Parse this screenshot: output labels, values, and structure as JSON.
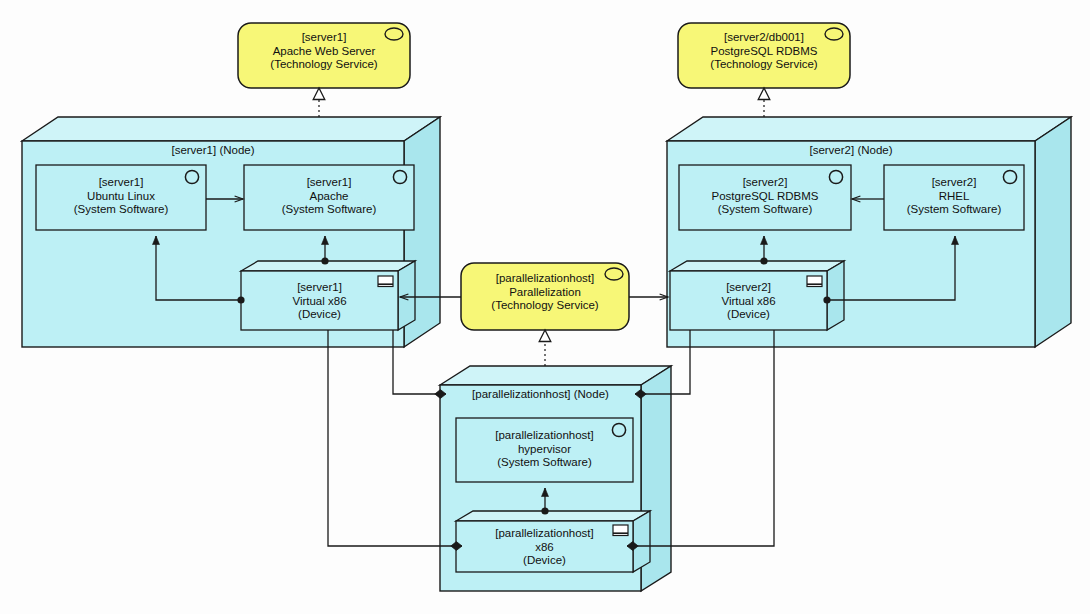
{
  "diagram": {
    "notation": "ArchiMate",
    "colors": {
      "service_fill": "#F7F777",
      "node_fill": "#BDF0F5",
      "node_top_fill": "#CFF4F8",
      "node_side_fill": "#A9E6ED",
      "inner_fill": "#BDF0F5",
      "stroke": "#1a1a1a",
      "background": "#FDFDFD"
    }
  },
  "services": [
    {
      "id": "apache-web-server",
      "qualifier": "[server1]",
      "name": "Apache Web Server",
      "type": "(Technology Service)",
      "icon": "rounded-oval-icon"
    },
    {
      "id": "postgresql-rdbms-service",
      "qualifier": "[server2/db001]",
      "name": "PostgreSQL RDBMS",
      "type": "(Technology Service)",
      "icon": "rounded-oval-icon"
    },
    {
      "id": "parallelization",
      "qualifier": "[parallelizationhost]",
      "name": "Parallelization",
      "type": "(Technology Service)",
      "icon": "rounded-oval-icon"
    }
  ],
  "nodes": [
    {
      "id": "server1-node",
      "title": "[server1] (Node)",
      "system_software": [
        {
          "id": "server1-ubuntu",
          "qualifier": "[server1]",
          "name": "Ubuntu Linux",
          "type": "(System Software)",
          "icon": "circle-icon"
        },
        {
          "id": "server1-apache",
          "qualifier": "[server1]",
          "name": "Apache",
          "type": "(System Software)",
          "icon": "circle-icon"
        }
      ],
      "devices": [
        {
          "id": "server1-virtual-x86",
          "qualifier": "[server1]",
          "name": "Virtual x86",
          "type": "(Device)",
          "icon": "monitor-icon"
        }
      ]
    },
    {
      "id": "server2-node",
      "title": "[server2] (Node)",
      "system_software": [
        {
          "id": "server2-postgresql",
          "qualifier": "[server2]",
          "name": "PostgreSQL RDBMS",
          "type": "(System Software)",
          "icon": "circle-icon"
        },
        {
          "id": "server2-rhel",
          "qualifier": "[server2]",
          "name": "RHEL",
          "type": "(System Software)",
          "icon": "circle-icon"
        }
      ],
      "devices": [
        {
          "id": "server2-virtual-x86",
          "qualifier": "[server2]",
          "name": "Virtual x86",
          "type": "(Device)",
          "icon": "monitor-icon"
        }
      ]
    },
    {
      "id": "parallelizationhost-node",
      "title": "[parallelizationhost] (Node)",
      "system_software": [
        {
          "id": "parallelizationhost-hypervisor",
          "qualifier": "[parallelizationhost]",
          "name": "hypervisor",
          "type": "(System Software)",
          "icon": "circle-icon"
        }
      ],
      "devices": [
        {
          "id": "parallelizationhost-x86",
          "qualifier": "[parallelizationhost]",
          "name": "x86",
          "type": "(Device)",
          "icon": "monitor-icon"
        }
      ]
    }
  ],
  "relationships": [
    {
      "id": "r1",
      "kind": "realization",
      "from": "server1-apache",
      "to": "apache-web-server"
    },
    {
      "id": "r2",
      "kind": "realization",
      "from": "server2-postgresql",
      "to": "postgresql-rdbms-service"
    },
    {
      "id": "r3",
      "kind": "realization",
      "from": "parallelizationhost-hypervisor",
      "to": "parallelization"
    },
    {
      "id": "r4",
      "kind": "serving",
      "from": "server1-ubuntu",
      "to": "server1-apache"
    },
    {
      "id": "r5",
      "kind": "serving",
      "from": "server2-rhel",
      "to": "server2-postgresql"
    },
    {
      "id": "r6",
      "kind": "assignment",
      "from": "server1-virtual-x86",
      "to": "server1-ubuntu"
    },
    {
      "id": "r7",
      "kind": "assignment",
      "from": "server1-virtual-x86",
      "to": "server1-apache"
    },
    {
      "id": "r8",
      "kind": "assignment",
      "from": "server2-virtual-x86",
      "to": "server2-postgresql"
    },
    {
      "id": "r9",
      "kind": "assignment",
      "from": "server2-virtual-x86",
      "to": "server2-rhel"
    },
    {
      "id": "r10",
      "kind": "assignment",
      "from": "parallelizationhost-x86",
      "to": "parallelizationhost-hypervisor"
    },
    {
      "id": "r11",
      "kind": "serving",
      "from": "parallelization",
      "to": "server1-virtual-x86"
    },
    {
      "id": "r12",
      "kind": "serving",
      "from": "parallelization",
      "to": "server2-virtual-x86"
    },
    {
      "id": "r13",
      "kind": "composition",
      "from": "parallelizationhost-node",
      "to": "server1-virtual-x86"
    },
    {
      "id": "r14",
      "kind": "composition",
      "from": "parallelizationhost-node",
      "to": "server2-virtual-x86"
    },
    {
      "id": "r15",
      "kind": "composition",
      "from": "parallelizationhost-x86",
      "to": "server1-virtual-x86"
    },
    {
      "id": "r16",
      "kind": "composition",
      "from": "parallelizationhost-x86",
      "to": "server2-virtual-x86"
    }
  ]
}
